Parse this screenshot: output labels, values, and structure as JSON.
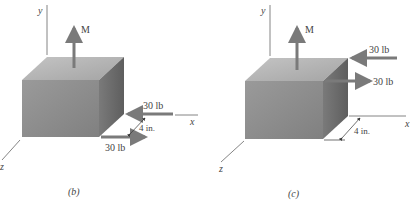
{
  "figures": [
    {
      "id": "b",
      "caption": "(b)",
      "axes": {
        "x": "x",
        "y": "y",
        "z": "z"
      },
      "moment_label": "M",
      "forces": [
        {
          "label": "30 lb",
          "direction": "-x",
          "position": "upper"
        },
        {
          "label": "30 lb",
          "direction": "+x",
          "position": "lower"
        }
      ],
      "dimension": "4 in."
    },
    {
      "id": "c",
      "caption": "(c)",
      "axes": {
        "x": "x",
        "y": "y",
        "z": "z"
      },
      "moment_label": "M",
      "forces": [
        {
          "label": "30 lb",
          "direction": "-x",
          "position": "upper"
        },
        {
          "label": "30 lb",
          "direction": "+x",
          "position": "lower"
        }
      ],
      "dimension": "4 in."
    }
  ],
  "colors": {
    "front_face": "#8c8c8c",
    "top_face": "#b4b4b4",
    "side_face": "#6a6a6a",
    "arrow": "#7a7a7a",
    "axis": "#555555"
  }
}
